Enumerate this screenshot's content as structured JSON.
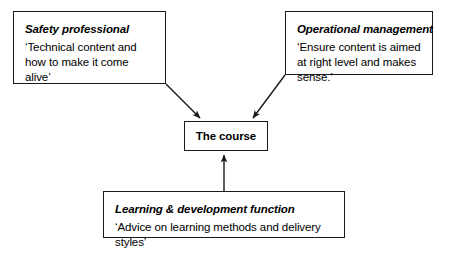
{
  "diagram": {
    "background_color": "#ffffff",
    "line_color": "#1a1a1a",
    "text_color": "#000000",
    "center_node": {
      "label": "The course"
    },
    "nodes": [
      {
        "id": "safety-professional",
        "heading": "Safety professional",
        "quote": "‘Technical content and how to make it come alive’"
      },
      {
        "id": "operational-management",
        "heading": "Operational management",
        "quote": "‘Ensure content is aimed at right level and makes sense.’"
      },
      {
        "id": "learning-development-function",
        "heading": "Learning & development function",
        "quote": "‘Advice on learning methods and delivery styles’"
      }
    ],
    "connectors": [
      {
        "from": "safety-professional",
        "to": "center_node",
        "style": "elbow-diagonal-arrow"
      },
      {
        "from": "operational-management",
        "to": "center_node",
        "style": "elbow-diagonal-arrow"
      },
      {
        "from": "learning-development-function",
        "to": "center_node",
        "style": "vertical-arrow"
      }
    ]
  }
}
